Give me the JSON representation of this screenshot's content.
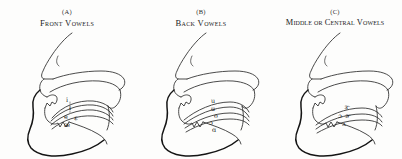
{
  "figure": {
    "kind": "sagittal-vocal-tract-vowel-diagram",
    "panel_count": 3,
    "background_color": "#fdfdfc",
    "stroke_color": "#2a2a2a",
    "jaw_stroke_color": "#141414"
  },
  "panels": [
    {
      "id": "a",
      "letter": "(A)",
      "title": "Front Vowels",
      "vowel_symbols": [
        "i",
        "ɪ",
        "e",
        "ɛ",
        "æ"
      ],
      "tongue_curve_count": 4,
      "tongue_position": "front"
    },
    {
      "id": "b",
      "letter": "(B)",
      "title": "Back Vowels",
      "vowel_symbols": [
        "u",
        "ʊ",
        "o",
        "ɔ",
        "ɑ"
      ],
      "tongue_curve_count": 4,
      "tongue_position": "back"
    },
    {
      "id": "c",
      "letter": "(C)",
      "title": "Middle or Central Vowels",
      "vowel_symbols": [
        "ɝ",
        "ɔ",
        "ɚ",
        "ʌ"
      ],
      "tongue_curve_count": 3,
      "tongue_position": "central"
    }
  ],
  "anatomy_parts": [
    "nose",
    "nostril",
    "upper-lip",
    "hard-palate",
    "soft-palate",
    "uvula",
    "pharyngeal-wall",
    "tongue",
    "lower-lip",
    "jaw",
    "chin"
  ]
}
